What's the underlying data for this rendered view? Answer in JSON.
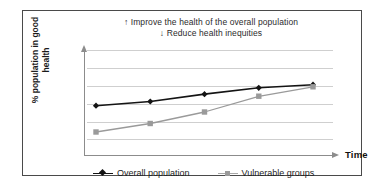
{
  "figure": {
    "title_lines": [
      "↑ Improve the health of the overall population",
      "↓ Reduce health inequities"
    ],
    "y_axis_title_lines": [
      "% population in good",
      "health"
    ],
    "x_axis_title": "Time",
    "frame_color": "#4a4a4a",
    "background": "#ffffff"
  },
  "legend": {
    "position": "bottom",
    "entries": [
      {
        "label": "Overall population",
        "marker": "diamond",
        "color": "#141414"
      },
      {
        "label": "Vulnerable groups",
        "marker": "square",
        "color": "#9a9a9a"
      }
    ]
  },
  "chart_data": {
    "type": "line",
    "title": "↑ Improve the health of the overall population ↓ Reduce health inequities",
    "xlabel": "Time",
    "ylabel": "% population in good health",
    "x": [
      1,
      2,
      3,
      4,
      5
    ],
    "xtick_labels": [
      "",
      "",
      "",
      "",
      ""
    ],
    "ytick_labels": [
      "",
      "",
      "",
      "",
      "",
      ""
    ],
    "xlim": [
      0,
      6
    ],
    "ylim": [
      0,
      100
    ],
    "grid": true,
    "gridlines_y": [
      14,
      31,
      48,
      65,
      82,
      99
    ],
    "series": [
      {
        "name": "Overall population",
        "color": "#141414",
        "marker": "diamond",
        "values": [
          46,
          50,
          57,
          63,
          66
        ]
      },
      {
        "name": "Vulnerable groups",
        "color": "#9a9a9a",
        "marker": "square",
        "values": [
          21,
          29,
          40,
          55,
          64
        ]
      }
    ],
    "annotations": [
      "↑ Improve the health of the overall population",
      "↓ Reduce health inequities"
    ]
  }
}
